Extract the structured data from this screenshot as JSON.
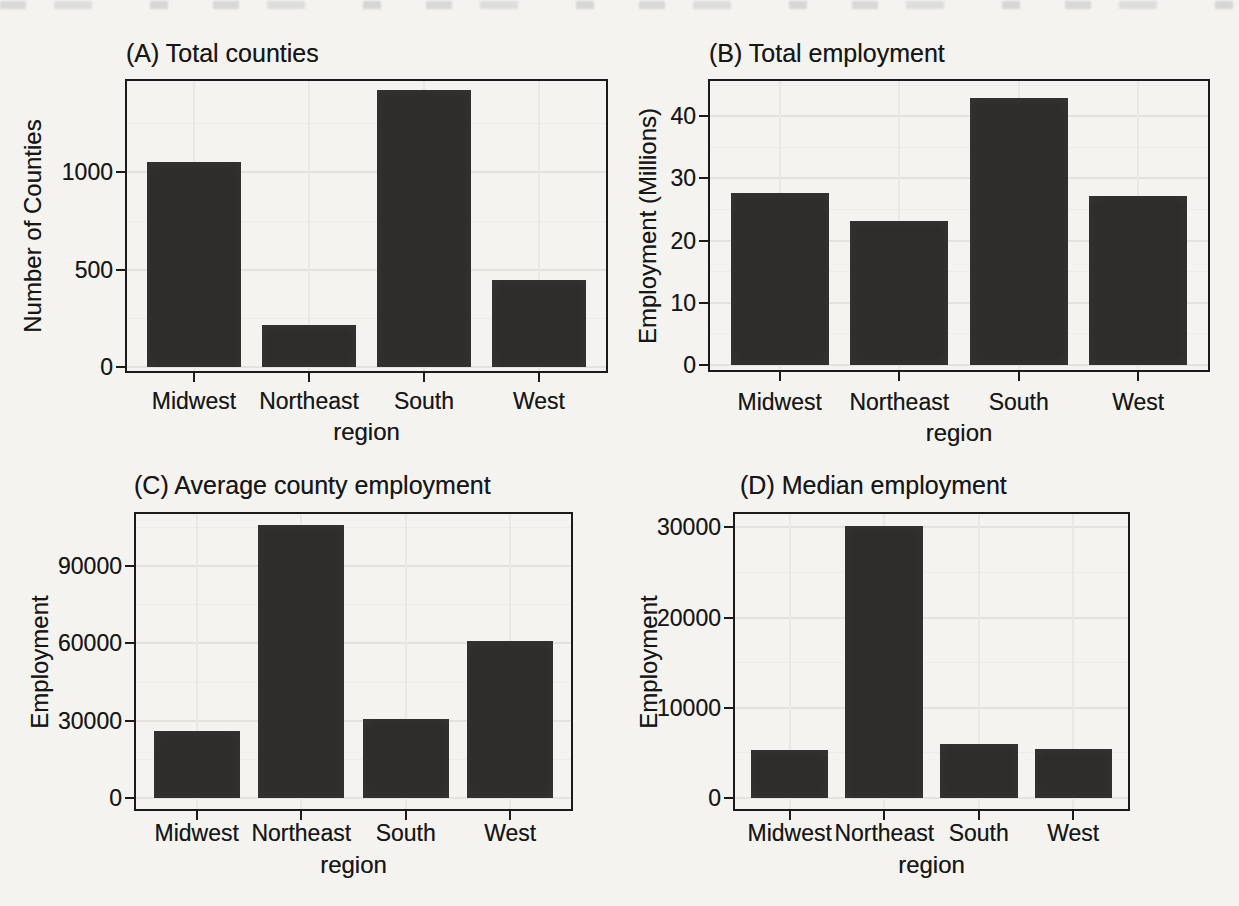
{
  "figure": {
    "kind": "2x2 grid of bar charts",
    "background_color": "#f4f3f0",
    "bar_color": "#2e2d2c",
    "panel_border_color": "#1b1b1b",
    "grid_major_color": "#e3e2de",
    "grid_minor_color": "#edece9",
    "text_color": "#171717"
  },
  "chart_data": [
    {
      "id": "A",
      "type": "bar",
      "title": "(A) Total counties",
      "xlabel": "region",
      "ylabel": "Number of Counties",
      "categories": [
        "Midwest",
        "Northeast",
        "South",
        "West"
      ],
      "values": [
        1055,
        217,
        1422,
        448
      ],
      "yticks": [
        0,
        500,
        1000
      ],
      "yticks_minor": [
        250,
        750,
        1250
      ],
      "ylim": [
        0,
        1480
      ],
      "grid": "major+minor horizontal, major vertical",
      "legend": "none"
    },
    {
      "id": "B",
      "type": "bar",
      "title": "(B) Total employment",
      "xlabel": "region",
      "ylabel": "Employment (Millions)",
      "categories": [
        "Midwest",
        "Northeast",
        "South",
        "West"
      ],
      "values": [
        27.6,
        23.1,
        43,
        27.2
      ],
      "yticks": [
        0,
        10,
        20,
        30,
        40
      ],
      "yticks_minor": [
        5,
        15,
        25,
        35,
        45
      ],
      "ylim": [
        0,
        46
      ],
      "grid": "major+minor horizontal, major vertical",
      "legend": "none"
    },
    {
      "id": "C",
      "type": "bar",
      "title": "(C) Average county employment",
      "xlabel": "region",
      "ylabel": "Employment",
      "categories": [
        "Midwest",
        "Northeast",
        "South",
        "West"
      ],
      "values": [
        26000,
        106000,
        30500,
        61000
      ],
      "yticks": [
        0,
        30000,
        60000,
        90000
      ],
      "yticks_minor": [
        15000,
        45000,
        75000,
        105000
      ],
      "ylim": [
        0,
        111000
      ],
      "grid": "major+minor horizontal, major vertical",
      "legend": "none"
    },
    {
      "id": "D",
      "type": "bar",
      "title": "(D) Median employment",
      "xlabel": "region",
      "ylabel": "Employment",
      "categories": [
        "Midwest",
        "Northeast",
        "South",
        "West"
      ],
      "values": [
        5300,
        30100,
        6000,
        5400
      ],
      "yticks": [
        0,
        10000,
        20000,
        30000
      ],
      "yticks_minor": [
        5000,
        15000,
        25000
      ],
      "ylim": [
        0,
        31700
      ],
      "grid": "major+minor horizontal, major vertical",
      "legend": "none"
    }
  ]
}
